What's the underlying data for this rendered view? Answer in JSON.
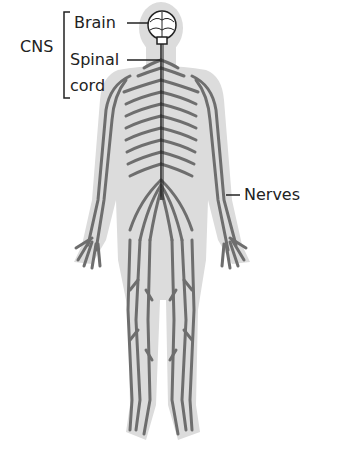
{
  "labels": {
    "cns": "CNS",
    "brain": "Brain",
    "spinal_cord_line1": "Spinal",
    "spinal_cord_line2": "cord",
    "nerves": "Nerves"
  },
  "colors": {
    "body_fill": "#dcdcdc",
    "nerve": "#6e6e6e",
    "outline": "#222222",
    "text": "#222222"
  }
}
